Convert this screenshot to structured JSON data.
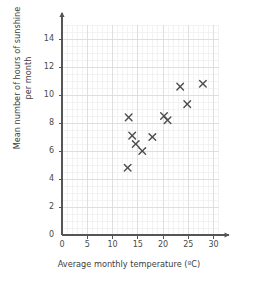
{
  "chart_data": {
    "type": "scatter",
    "title": "",
    "xlabel": "Average monthly temperature (ºC)",
    "ylabel_line1": "Mean number of hours of sunshine",
    "ylabel_line2": "per month",
    "xlim": [
      0,
      31
    ],
    "ylim": [
      0,
      15
    ],
    "xticks": [
      0,
      5,
      10,
      15,
      20,
      25,
      30
    ],
    "yticks": [
      0,
      2,
      4,
      6,
      8,
      10,
      12,
      14
    ],
    "xtick_labels": [
      "0",
      "5",
      "10",
      "15",
      "20",
      "25",
      "30"
    ],
    "ytick_labels": [
      "0",
      "2",
      "4",
      "6",
      "8",
      "10",
      "12",
      "14"
    ],
    "x_minor_step": 1,
    "y_minor_step": 0.5,
    "grid": true,
    "grid_major_color": "#d9d9d9",
    "grid_minor_color": "#eeeeee",
    "axis_color": "#555555",
    "marker": "x",
    "marker_color": "#4d4d4d",
    "legend": "none",
    "points": [
      {
        "x": 13.2,
        "y": 8.4
      },
      {
        "x": 13.0,
        "y": 4.8
      },
      {
        "x": 13.9,
        "y": 7.1
      },
      {
        "x": 14.6,
        "y": 6.5
      },
      {
        "x": 15.9,
        "y": 6.0
      },
      {
        "x": 17.9,
        "y": 7.0
      },
      {
        "x": 20.2,
        "y": 8.5
      },
      {
        "x": 20.9,
        "y": 8.2
      },
      {
        "x": 23.4,
        "y": 10.6
      },
      {
        "x": 24.8,
        "y": 9.35
      },
      {
        "x": 27.9,
        "y": 10.8
      }
    ]
  },
  "axes_geometry": {
    "plot_left_px": 62,
    "plot_right_px": 232,
    "plot_bottom_px": 235,
    "plot_top_px": 26,
    "x_zero_px": 62,
    "y_zero_px": 235,
    "px_per_x_unit": 5.05,
    "px_per_y_unit": 14.0
  }
}
